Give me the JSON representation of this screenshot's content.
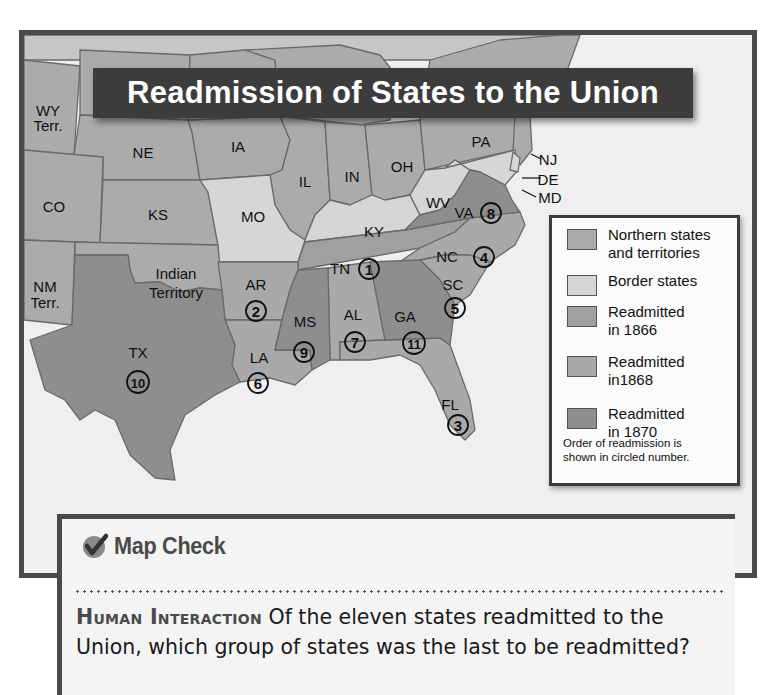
{
  "title": "Readmission of States to the Union",
  "colors": {
    "northern": "#ababab",
    "border": "#d6d6d6",
    "readmitted_1866": "#a0a0a0",
    "readmitted_1868": "#a9a9a9",
    "readmitted_1870": "#8e8e8e",
    "frame": "#4a4a4a",
    "title_bg": "#3c3c3c"
  },
  "map": {
    "labels": {
      "wy": "WY",
      "wy2": "Terr.",
      "ne": "NE",
      "ia": "IA",
      "il": "IL",
      "in": "IN",
      "oh": "OH",
      "pa": "PA",
      "nj": "NJ",
      "de": "DE",
      "md": "MD",
      "wv": "WV",
      "va": "VA",
      "co": "CO",
      "ks": "KS",
      "mo": "MO",
      "ky": "KY",
      "tn": "TN",
      "nc": "NC",
      "nm": "NM",
      "nm2": "Terr.",
      "it": "Indian",
      "it2": "Territory",
      "ar": "AR",
      "sc": "SC",
      "ms": "MS",
      "al": "AL",
      "ga": "GA",
      "tx": "TX",
      "la": "LA",
      "fl": "FL"
    },
    "readmission_order": {
      "tn": "1",
      "ar": "2",
      "fl": "3",
      "nc": "4",
      "sc": "5",
      "la": "6",
      "al": "7",
      "va": "8",
      "ms": "9",
      "tx": "10",
      "ga": "11"
    }
  },
  "legend": {
    "items": [
      {
        "label": "Northern states and territories",
        "line1": "Northern states",
        "line2": "and territories"
      },
      {
        "label": "Border states",
        "line1": "Border states",
        "line2": ""
      },
      {
        "label": "Readmitted in 1866",
        "line1": "Readmitted",
        "line2": "in 1866"
      },
      {
        "label": "Readmitted in1868",
        "line1": "Readmitted",
        "line2": "in1868"
      },
      {
        "label": "Readmitted in 1870",
        "line1": "Readmitted",
        "line2": "in 1870"
      }
    ],
    "note_line1": "Order of readmission is",
    "note_line2": "shown in circled number."
  },
  "map_check": {
    "heading": "Map Check",
    "kicker": "Human Interaction",
    "question": " Of the eleven states readmitted to the Union, which group of states was the last to be readmitted?"
  }
}
